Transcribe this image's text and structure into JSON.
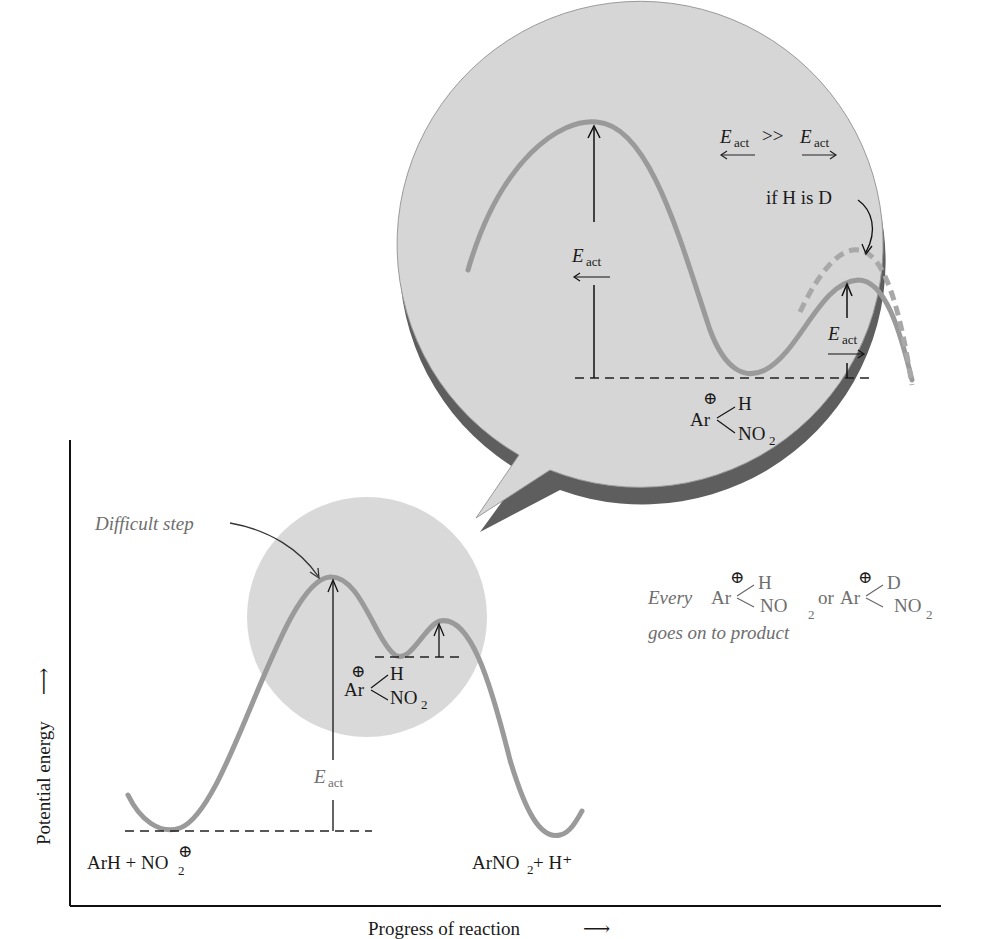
{
  "diagram": {
    "type": "reaction energy diagram",
    "axes": {
      "y_label": "Potential energy",
      "y_arrow": "⟶",
      "x_label": "Progress of reaction",
      "x_arrow": "⟶"
    },
    "main_plot": {
      "reactants_label": "ArH + NO",
      "reactants_sub": "2",
      "reactants_charge": "⊕",
      "products_label": "ArNO",
      "products_sub": "2",
      "products_tail": " + H⁺",
      "difficult_step_label": "Difficult step",
      "eact_main": "E",
      "eact_sub": "act",
      "intermediate": {
        "charge": "⊕",
        "ar": "Ar",
        "top": "H",
        "bottom": "NO",
        "bottom_sub": "2"
      }
    },
    "zoom_bubble": {
      "comparison": {
        "left_e": "E",
        "left_sub": "act",
        "left_arrow": "⟵",
        "operator": ">>",
        "right_e": "E",
        "right_sub": "act",
        "right_arrow": "⟶"
      },
      "isotope_note": "if H is D",
      "eact_reverse": {
        "e": "E",
        "sub": "act",
        "arrow": "⟵"
      },
      "eact_forward": {
        "e": "E",
        "sub": "act",
        "arrow": "⟶"
      },
      "intermediate": {
        "charge": "⊕",
        "ar": "Ar",
        "top": "H",
        "bottom": "NO",
        "bottom_sub": "2"
      }
    },
    "caption": {
      "every": "Every",
      "first": {
        "charge": "⊕",
        "ar": "Ar",
        "top": "H",
        "bottom": "NO",
        "bottom_sub": "2"
      },
      "or": "or",
      "second": {
        "charge": "⊕",
        "ar": "Ar",
        "top": "D",
        "bottom": "NO",
        "bottom_sub": "2"
      },
      "line2": "goes on to product"
    },
    "colors": {
      "curve": "#9a9a9a",
      "bubble_fill": "#d6d6d6",
      "bubble_shadow": "#5e5e5e",
      "highlight_circle": "#d9d9d9",
      "axis": "#1a1a1a",
      "annotation_text": "#6e6e6e"
    }
  }
}
